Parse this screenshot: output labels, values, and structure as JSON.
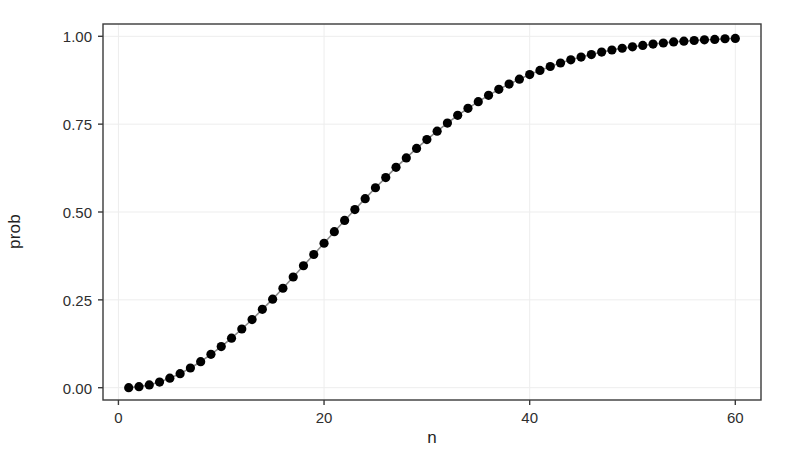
{
  "chart_data": {
    "type": "line",
    "title": "",
    "subtitle": "",
    "xlabel": "n",
    "ylabel": "prob",
    "xlim": [
      -1.5,
      62.5
    ],
    "ylim": [
      -0.035,
      1.035
    ],
    "grid": true,
    "legend": "none",
    "x_ticks": [
      0,
      20,
      40,
      60
    ],
    "x_tick_labels": [
      "0",
      "20",
      "40",
      "60"
    ],
    "y_ticks": [
      0.0,
      0.25,
      0.5,
      0.75,
      1.0
    ],
    "y_tick_labels": [
      "0.00",
      "0.25",
      "0.50",
      "0.75",
      "1.00"
    ],
    "series": [
      {
        "name": "prob",
        "marker": "filled-circle",
        "marker_color": "#000000",
        "line_color": "#8a8a8a",
        "x": [
          1,
          2,
          3,
          4,
          5,
          6,
          7,
          8,
          9,
          10,
          11,
          12,
          13,
          14,
          15,
          16,
          17,
          18,
          19,
          20,
          21,
          22,
          23,
          24,
          25,
          26,
          27,
          28,
          29,
          30,
          31,
          32,
          33,
          34,
          35,
          36,
          37,
          38,
          39,
          40,
          41,
          42,
          43,
          44,
          45,
          46,
          47,
          48,
          49,
          50,
          51,
          52,
          53,
          54,
          55,
          56,
          57,
          58,
          59,
          60
        ],
        "values": [
          0.0,
          0.003,
          0.008,
          0.016,
          0.027,
          0.04,
          0.056,
          0.074,
          0.095,
          0.117,
          0.141,
          0.167,
          0.194,
          0.223,
          0.252,
          0.283,
          0.315,
          0.347,
          0.379,
          0.411,
          0.444,
          0.476,
          0.507,
          0.538,
          0.569,
          0.598,
          0.627,
          0.654,
          0.681,
          0.706,
          0.73,
          0.753,
          0.775,
          0.795,
          0.814,
          0.832,
          0.849,
          0.864,
          0.878,
          0.891,
          0.903,
          0.914,
          0.924,
          0.933,
          0.941,
          0.948,
          0.955,
          0.961,
          0.966,
          0.97,
          0.974,
          0.978,
          0.981,
          0.984,
          0.986,
          0.988,
          0.99,
          0.991,
          0.993,
          0.994
        ]
      }
    ]
  },
  "axis": {
    "x_title": "n",
    "y_title": "prob"
  },
  "style": {
    "panel_background": "#ffffff",
    "panel_border": "#3a3a3a",
    "grid_color": "#ededed",
    "point_color": "#000000",
    "line_color": "#8a8a8a",
    "tick_color": "#3a3a3a",
    "text_color": "#2e2e2e"
  },
  "panel": {
    "left": 103,
    "right": 761,
    "top": 24,
    "bottom": 400
  }
}
